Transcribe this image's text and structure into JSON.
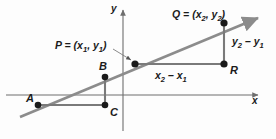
{
  "figure": {
    "type": "coordinate-geometry-diagram",
    "colors": {
      "background": "#fdfdfd",
      "axis": "#6e6e6e",
      "line": "#8c8c8c",
      "segment": "#7a7a7a",
      "point": "#1a1a1a",
      "text": "#1b1b1b",
      "leader": "#8c8c8c"
    },
    "axes": {
      "x_label": "x",
      "y_label": "y",
      "x_axis_y_px": 95,
      "y_axis_x_px": 123
    },
    "points": [
      {
        "key": "A",
        "label": "A",
        "x": 38,
        "y": 105
      },
      {
        "key": "B",
        "label": "B",
        "x": 105,
        "y": 77
      },
      {
        "key": "C",
        "label": "C",
        "x": 105,
        "y": 105
      },
      {
        "key": "P",
        "label": "P",
        "x": 135,
        "y": 64
      },
      {
        "key": "Q",
        "label": "Q",
        "x": 224,
        "y": 23
      },
      {
        "key": "R",
        "label": "R",
        "x": 224,
        "y": 64
      }
    ],
    "labels": {
      "point_A": "A",
      "point_B": "B",
      "point_C": "C",
      "point_R": "R",
      "P_coord_prefix": "P = (x",
      "P_sub_1": "1",
      "P_mid": ", y",
      "P_sub_2": "1",
      "P_suffix": ")",
      "Q_coord_prefix": "Q = (x",
      "Q_sub_1": "2",
      "Q_mid": ", y",
      "Q_sub_2": "2",
      "Q_suffix": ")",
      "run_prefix": "x",
      "run_sub_1": "2",
      "run_minus": " – x",
      "run_sub_2": "1",
      "rise_prefix": "y",
      "rise_sub_1": "2",
      "rise_minus": " – y",
      "rise_sub_2": "1",
      "axis_x": "x",
      "axis_y": "y"
    },
    "segments": {
      "run_label_text": "x2 - x1",
      "rise_label_text": "y2 - y1",
      "line_start": {
        "x": 20,
        "y": 117
      },
      "line_end": {
        "x": 262,
        "y": 16
      }
    },
    "leader": {
      "from": {
        "x": 116,
        "y": 50
      },
      "to": {
        "x": 132,
        "y": 61
      }
    }
  }
}
